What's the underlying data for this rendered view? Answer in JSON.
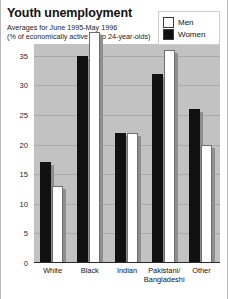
{
  "title": "Youth unemployment",
  "subtitle_line1": "Averages for June 1995-May 1996",
  "subtitle_line2": "(% of economically active 16 to 24-year-olds)",
  "legend": {
    "items": [
      {
        "label": "Men",
        "color": "#ffffff",
        "icon": "white-square-swatch"
      },
      {
        "label": "Women",
        "color": "#111111",
        "icon": "black-square-swatch"
      }
    ]
  },
  "axis": {
    "y_ticks": [
      "0",
      "5",
      "10",
      "15",
      "20",
      "25",
      "30",
      "35"
    ],
    "x_labels": [
      {
        "line1": "White",
        "line2": ""
      },
      {
        "line1": "Black",
        "line2": ""
      },
      {
        "line1": "Indian",
        "line2": ""
      },
      {
        "line1": "Pakistani/",
        "line2": "Bangladeshi"
      },
      {
        "line1": "Other",
        "line2": ""
      }
    ]
  },
  "chart_data": {
    "type": "bar",
    "title": "Youth unemployment",
    "subtitle": "Averages for June 1995-May 1996 (% of economically active 16 to 24-year-olds)",
    "xlabel": "",
    "ylabel": "",
    "ylim": [
      0,
      37
    ],
    "ytick_values": [
      0,
      5,
      10,
      15,
      20,
      25,
      30,
      35
    ],
    "grid": true,
    "legend_position": "top-right",
    "categories": [
      "White",
      "Black",
      "Indian",
      "Pakistani/Bangladeshi",
      "Other"
    ],
    "series": [
      {
        "name": "Women",
        "color": "#111111",
        "values": [
          17,
          35,
          22,
          32,
          26
        ]
      },
      {
        "name": "Men",
        "color": "#ffffff",
        "values": [
          13,
          39,
          22,
          36,
          20
        ]
      }
    ]
  }
}
